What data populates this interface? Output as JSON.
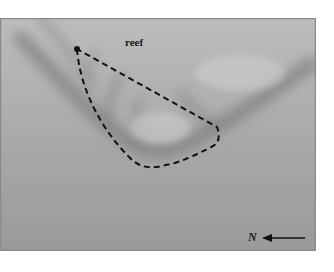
{
  "figure": {
    "type": "aerial-photo-annotation",
    "labels": {
      "reef": "reef",
      "north": "N"
    },
    "annotations": {
      "marker": "filled-dot",
      "outline": "dashed-closed-curve",
      "compass": "north-arrow-pointing-left"
    },
    "colors": {
      "background_light": "#bdbdbd",
      "background_dark": "#8e8e8e",
      "ink": "#111111"
    }
  }
}
